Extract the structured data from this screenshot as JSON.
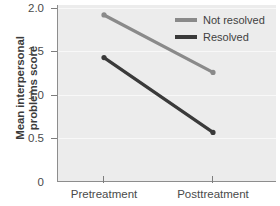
{
  "chart_data": {
    "type": "line",
    "title": "",
    "xlabel": "",
    "ylabel": "Mean interpersonal problems score",
    "ylabel_line1": "Mean interpersonal",
    "ylabel_line2": "problems score",
    "categories": [
      "Pretreatment",
      "Posttreatment"
    ],
    "series": [
      {
        "name": "Not resolved",
        "values": [
          1.92,
          1.26
        ],
        "color": "#8a8a8a"
      },
      {
        "name": "Resolved",
        "values": [
          1.43,
          0.57
        ],
        "color": "#3a3a3a"
      }
    ],
    "ylim": [
      0,
      2.0
    ],
    "yticks": [
      0,
      0.5,
      1.0,
      1.5,
      2.0
    ],
    "ytick_labels": [
      "0",
      "0.5",
      "1.0",
      "1.5",
      "2.0"
    ],
    "grid": true,
    "grid_color": "#f8f8f8",
    "plot_background": "#ececec",
    "legend_position": "top-right",
    "markers": true
  },
  "legend": {
    "entries": [
      {
        "label": "Not resolved",
        "color": "#8a8a8a"
      },
      {
        "label": "Resolved",
        "color": "#3a3a3a"
      }
    ]
  },
  "axes": {
    "y_title_line1": "Mean interpersonal",
    "y_title_line2": "problems score",
    "y_tick_labels": [
      "2.0",
      "1.5",
      "1.0",
      "0.5",
      "0"
    ],
    "x_tick_labels": [
      "Pretreatment",
      "Posttreatment"
    ]
  }
}
